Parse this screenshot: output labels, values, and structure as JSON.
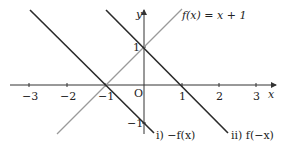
{
  "diagram": {
    "type": "function-graph",
    "axes": {
      "x_label": "x",
      "y_label": "y",
      "origin_label": "O",
      "x_ticks": [
        "−3",
        "−2",
        "−1",
        "1",
        "2",
        "3"
      ],
      "y_ticks": [
        "1",
        "−1"
      ]
    },
    "lines": [
      {
        "name": "f(x) = x + 1",
        "label": "f(x) = x + 1",
        "color": "#9a9a9a",
        "slope": 1,
        "intercept": 1
      },
      {
        "name": "-f(x)",
        "label": "i)  −f(x)",
        "color": "#2a2a2a",
        "slope": -1,
        "intercept": -1
      },
      {
        "name": "f(-x)",
        "label": "ii)  f(−x)",
        "color": "#2a2a2a",
        "slope": -1,
        "intercept": 1
      }
    ]
  }
}
